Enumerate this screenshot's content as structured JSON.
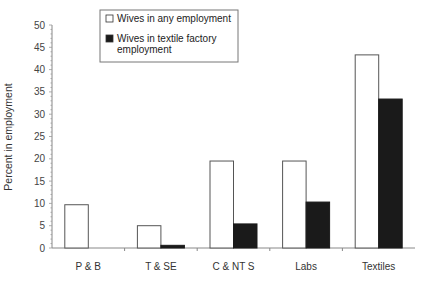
{
  "chart_data": {
    "type": "bar",
    "title": "",
    "xlabel": "",
    "ylabel": "Percent in employment",
    "ylim": [
      0,
      50
    ],
    "yticks": [
      0,
      5,
      10,
      15,
      20,
      25,
      30,
      35,
      40,
      45,
      50
    ],
    "grid": false,
    "legend_position": "top-center",
    "categories": [
      "P & B",
      "T & SE",
      "C & NT S",
      "Labs",
      "Textiles"
    ],
    "series": [
      {
        "name": "Wives in any employment",
        "fill": "#ffffff",
        "values": [
          9.7,
          5.0,
          19.5,
          19.5,
          43.3
        ]
      },
      {
        "name": "Wives in textile factory employment",
        "fill": "#1a1a1a",
        "values": [
          0,
          0.6,
          5.4,
          10.3,
          33.4
        ]
      }
    ],
    "legend": {
      "entries": [
        {
          "lines": [
            "Wives in any employment"
          ]
        },
        {
          "lines": [
            "Wives in textile factory",
            "employment"
          ]
        }
      ]
    }
  }
}
